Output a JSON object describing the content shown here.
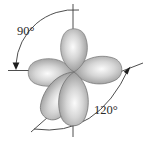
{
  "diagram": {
    "labels": {
      "angle_axial_equatorial": "90°",
      "angle_equatorial_equatorial": "120°"
    },
    "lobes": [
      {
        "name": "axial-up-lobe"
      },
      {
        "name": "equatorial-left-lobe"
      },
      {
        "name": "equatorial-right-lobe"
      },
      {
        "name": "equatorial-lower-left-lobe"
      },
      {
        "name": "equatorial-lower-center-lobe"
      }
    ],
    "colors": {
      "background": "#ffffff",
      "lobe_highlight": "#fafafa",
      "lobe_mid": "#c9c9c9",
      "lobe_edge": "#7d7d7d",
      "lobe_outline": "#6e6e6e",
      "line": "#3a3a3a",
      "text": "#2b2b2b"
    }
  }
}
